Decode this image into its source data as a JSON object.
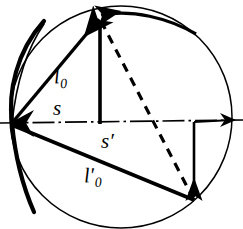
{
  "figure": {
    "type": "optics-geometry-diagram",
    "background_color": "#ffffff",
    "stroke_color": "#000000",
    "canvas": {
      "width": 243,
      "height": 229
    },
    "labels": {
      "l0": {
        "base": "l",
        "sub": "0",
        "prime": ""
      },
      "s": {
        "base": "s",
        "sub": "",
        "prime": ""
      },
      "s_prime": {
        "base": "s",
        "sub": "",
        "prime": "′"
      },
      "l0_prime": {
        "base": "l",
        "sub": "0",
        "prime": "′"
      }
    },
    "geometry": {
      "circle": {
        "cx": 121,
        "cy": 117,
        "r": 111
      },
      "vertex_left": {
        "x": 12,
        "y": 123
      },
      "vertex_right": {
        "x": 229,
        "y": 120
      },
      "point_top": {
        "x": 99,
        "y": 19
      },
      "point_bottom": {
        "x": 194,
        "y": 200
      },
      "foot_top": {
        "x": 100,
        "y": 123
      },
      "foot_bottom": {
        "x": 194,
        "y": 122
      },
      "axis_style": "dash-dot",
      "dashed_chord_style": "dashed",
      "mirror_arc": "thick concave arc on left"
    }
  }
}
